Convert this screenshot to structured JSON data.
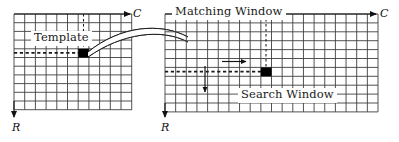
{
  "figure": {
    "background_color": "#ffffff",
    "grid_line_color": "#3a3a3a",
    "marker_color": "#000000",
    "dashed_color": "#1a1a1a",
    "width": 399,
    "height": 142
  },
  "labels": {
    "template": "Template",
    "matching_window": "Matching Window",
    "search_window": "Search Window",
    "column_axis_left": "C",
    "column_axis_right": "C",
    "row_axis_left": "R",
    "row_axis_right": "R"
  },
  "left_panel": {
    "name": "template-image-grid",
    "grid": {
      "x": 14,
      "y": 14,
      "columns": 11,
      "rows": 11,
      "cell_width": 10.7,
      "cell_height": 8.7
    },
    "marker_cell": {
      "column": 7,
      "row": 4,
      "label": "Template"
    },
    "dashed_vertical": {
      "column": 7,
      "from_row": 0,
      "to_row": 4
    },
    "dashed_horizontal": {
      "row": 4,
      "from_column": 0,
      "to_column": 7
    },
    "column_axis_arrow": {
      "direction": "right",
      "label": "C"
    },
    "row_axis_arrow": {
      "direction": "down",
      "label": "R"
    }
  },
  "right_panel": {
    "name": "search-image-grid",
    "grid": {
      "x": 165,
      "y": 14,
      "columns": 20,
      "rows": 11,
      "cell_width": 10.7,
      "cell_height": 8.9
    },
    "marker_cell": {
      "column": 10,
      "row": 6,
      "label": "Matching Window"
    },
    "dashed_vertical": {
      "column": 10,
      "from_row": 0,
      "to_row": 6
    },
    "dashed_horizontal": {
      "row": 6,
      "from_column": 0,
      "to_column": 10
    },
    "scan_arrow_horizontal": {
      "direction": "right",
      "length_cells": 4
    },
    "scan_arrow_vertical": {
      "direction": "down",
      "length_cells": 3
    },
    "column_axis_arrow": {
      "direction": "right",
      "label": "C"
    },
    "row_axis_arrow": {
      "direction": "down",
      "label": "R"
    }
  },
  "connector": {
    "name": "template-to-search-ribbon",
    "type": "curved-ribbon-arc",
    "from": "left_panel.marker_cell",
    "to": "right_panel.grid.left_edge"
  }
}
